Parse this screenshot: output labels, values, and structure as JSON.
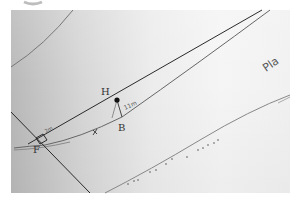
{
  "diagram": {
    "points": {
      "H": {
        "label": "H",
        "x": 117,
        "y": 100
      },
      "B": {
        "label": "B",
        "x": 122,
        "y": 117
      },
      "F": {
        "label": "F",
        "x": 38,
        "y": 139
      }
    },
    "annotations": {
      "segment_label_hb": "11m",
      "segment_label_f": "2m",
      "tick_mark": "x",
      "corner_text": "Pla"
    },
    "colors": {
      "ink": "#2a2a2a",
      "pencil": "#777777",
      "paper_dark": "#b9b9b9",
      "paper_light": "#f4f4f4"
    }
  }
}
